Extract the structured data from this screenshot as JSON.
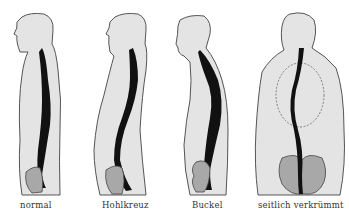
{
  "diagram": {
    "type": "spine-posture-comparison",
    "colors": {
      "body_fill": "#e4e4e4",
      "outline": "#555555",
      "spine": "#111111",
      "pelvis": "#a8a8a8",
      "background": "#ffffff"
    },
    "figures": [
      {
        "id": "normal",
        "label": "normal",
        "view": "side"
      },
      {
        "id": "hohlkreuz",
        "label": "Hohlkreuz",
        "view": "side"
      },
      {
        "id": "buckel",
        "label": "Buckel",
        "view": "side"
      },
      {
        "id": "skoliose",
        "label": "seitlich verkrümmt",
        "view": "back"
      }
    ]
  }
}
